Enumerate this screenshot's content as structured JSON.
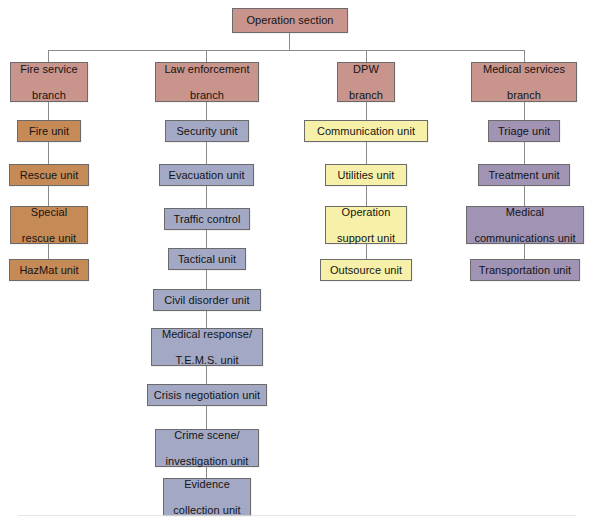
{
  "diagram": {
    "title": "Operation section",
    "type": "organizational-chart",
    "root": {
      "label": "Operation section",
      "color": "#c8948c"
    },
    "branches": [
      {
        "id": "fire-service",
        "label": "Fire service branch",
        "header_color": "#c8948c",
        "unit_color": "#c68a56",
        "units": [
          {
            "label": "Fire unit"
          },
          {
            "label": "Rescue unit"
          },
          {
            "label": "Special rescue unit"
          },
          {
            "label": "HazMat unit"
          }
        ]
      },
      {
        "id": "law-enforcement",
        "label": "Law enforcement branch",
        "header_color": "#c8948c",
        "unit_color": "#a3a9c4",
        "units": [
          {
            "label": "Security unit"
          },
          {
            "label": "Evacuation unit"
          },
          {
            "label": "Traffic control"
          },
          {
            "label": "Tactical unit"
          },
          {
            "label": "Civil disorder unit"
          },
          {
            "label": "Medical response/ T.E.M.S. unit"
          },
          {
            "label": "Crisis negotiation unit"
          },
          {
            "label": "Crime scene/ investigation unit"
          },
          {
            "label": "Evidence collection unit"
          }
        ]
      },
      {
        "id": "dpw",
        "label": "DPW branch",
        "header_color": "#c8948c",
        "unit_color": "#f7f0a8",
        "units": [
          {
            "label": "Communication unit"
          },
          {
            "label": "Utilities unit"
          },
          {
            "label": "Operation support unit"
          },
          {
            "label": "Outsource unit"
          }
        ]
      },
      {
        "id": "medical-services",
        "label": "Medical services branch",
        "header_color": "#c8948c",
        "unit_color": "#a193b4",
        "units": [
          {
            "label": "Triage unit"
          },
          {
            "label": "Treatment unit"
          },
          {
            "label": "Medical communications unit"
          },
          {
            "label": "Transportation unit"
          }
        ]
      }
    ],
    "nodes": {
      "root": "Operation section",
      "fire_branch_l1": "Fire service",
      "fire_branch_l2": "branch",
      "fire_u1": "Fire unit",
      "fire_u2": "Rescue unit",
      "fire_u3_l1": "Special",
      "fire_u3_l2": "rescue unit",
      "fire_u4": "HazMat unit",
      "law_branch_l1": "Law enforcement",
      "law_branch_l2": "branch",
      "law_u1": "Security unit",
      "law_u2": "Evacuation unit",
      "law_u3": "Traffic control",
      "law_u4": "Tactical unit",
      "law_u5": "Civil disorder unit",
      "law_u6_l1": "Medical response/",
      "law_u6_l2": "T.E.M.S. unit",
      "law_u7": "Crisis negotiation unit",
      "law_u8_l1": "Crime scene/",
      "law_u8_l2": "investigation unit",
      "law_u9_l1": "Evidence",
      "law_u9_l2": "collection unit",
      "dpw_branch_l1": "DPW",
      "dpw_branch_l2": "branch",
      "dpw_u1": "Communication unit",
      "dpw_u2": "Utilities unit",
      "dpw_u3_l1": "Operation",
      "dpw_u3_l2": "support unit",
      "dpw_u4": "Outsource unit",
      "med_branch_l1": "Medical services",
      "med_branch_l2": "branch",
      "med_u1": "Triage unit",
      "med_u2": "Treatment unit",
      "med_u3_l1": "Medical",
      "med_u3_l2": "communications unit",
      "med_u4": "Transportation unit"
    }
  }
}
